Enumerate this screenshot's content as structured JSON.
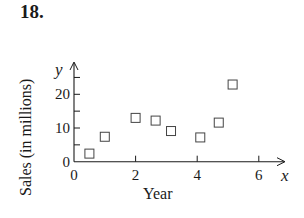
{
  "problem_number": "18.",
  "chart_data": {
    "type": "scatter",
    "title": "",
    "xlabel": "Year",
    "ylabel": "Sales (in millions)",
    "x_axis_var": "x",
    "y_axis_var": "y",
    "xlim": [
      0,
      7
    ],
    "ylim": [
      0,
      27
    ],
    "x_ticks": [
      0,
      2,
      4,
      6
    ],
    "x_minor_ticks": [],
    "y_ticks": [
      0,
      10,
      20
    ],
    "y_minor_ticks": [
      5,
      15,
      25
    ],
    "x_tick_labels": [
      "0",
      "2",
      "4",
      "6"
    ],
    "y_tick_labels": [
      "0",
      "10",
      "20"
    ],
    "grid": false,
    "marker": "open-square",
    "points": [
      {
        "x": 0.5,
        "y": 2.4
      },
      {
        "x": 1.0,
        "y": 7.4
      },
      {
        "x": 2.0,
        "y": 13.0
      },
      {
        "x": 2.65,
        "y": 12.2
      },
      {
        "x": 3.15,
        "y": 9.1
      },
      {
        "x": 4.1,
        "y": 7.2
      },
      {
        "x": 4.7,
        "y": 11.6
      },
      {
        "x": 5.15,
        "y": 22.9
      }
    ]
  },
  "colors": {
    "ink": "#1a1a1a",
    "marker_stroke": "#444444",
    "background": "#ffffff"
  }
}
